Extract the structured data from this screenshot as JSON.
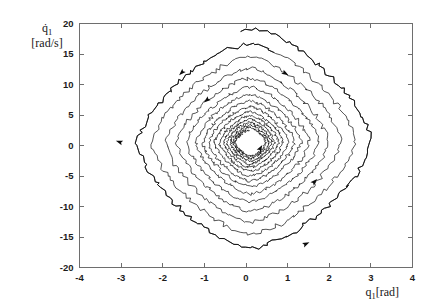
{
  "chart_data": {
    "type": "line",
    "title": "",
    "subtitle": "",
    "xlabel": "q_1[rad]",
    "xlabel_parts": {
      "symbol": "q",
      "subscript": "1",
      "unit": "[rad]"
    },
    "ylabel": "q̇_1 [rad/s]",
    "ylabel_parts": {
      "symbol": "q̇",
      "subscript": "1",
      "unit": "[rad/s]"
    },
    "xlim": [
      -4,
      4
    ],
    "ylim": [
      -20,
      20
    ],
    "xticks": [
      -4,
      -3,
      -2,
      -1,
      0,
      1,
      2,
      3,
      4
    ],
    "xtick_labels": [
      "-4",
      "-3",
      "-2",
      "-1",
      "0",
      "1",
      "2",
      "3",
      "4"
    ],
    "yticks": [
      -20,
      -15,
      -10,
      -5,
      0,
      5,
      10,
      15,
      20
    ],
    "ytick_labels": [
      "-20",
      "-15",
      "-10",
      "-5",
      "0",
      "5",
      "10",
      "15",
      "20"
    ],
    "grid": false,
    "legend": null,
    "box": true,
    "tick_direction": "in",
    "equilibrium": {
      "x": 0.1,
      "y": 0.5
    },
    "line_color": "#141414",
    "background_color": "#ffffff",
    "axis_color": "#6e6e6e",
    "series": [
      {
        "name": "phase trajectory",
        "kind": "inward-spiral",
        "turns": 15,
        "outer_extent": {
          "x_min": -3.05,
          "x_max": 3.0,
          "y_max": 19.0,
          "y_min": -18.6
        },
        "inner_extent": {
          "x_min": -0.1,
          "x_max": 0.35,
          "y_max": 1.6,
          "y_min": -0.4
        },
        "decay_per_turn": 0.135,
        "corner_sharpness": 2.6,
        "noise_amplitude": 0.02
      }
    ],
    "arrow_markers": [
      {
        "x": -1.55,
        "y": 11.9,
        "angle": 135
      },
      {
        "x": -3.05,
        "y": 0.6,
        "angle": 200
      },
      {
        "x": -0.95,
        "y": 7.4,
        "angle": 140
      },
      {
        "x": 1.65,
        "y": -5.9,
        "angle": -45
      },
      {
        "x": 0.35,
        "y": -0.4,
        "angle": -60
      },
      {
        "x": 0.95,
        "y": 11.8,
        "angle": 30
      },
      {
        "x": 1.45,
        "y": -16.1,
        "angle": -25
      }
    ]
  }
}
